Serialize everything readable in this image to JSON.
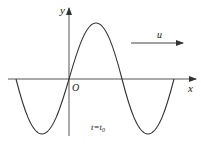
{
  "diagram": {
    "type": "transverse-wave",
    "labels": {
      "y_axis": "y",
      "x_axis": "x",
      "origin": "O",
      "velocity": "u",
      "time": "t=t",
      "time_subscript": "0"
    },
    "colors": {
      "stroke": "#333333",
      "background": "#ffffff"
    }
  }
}
